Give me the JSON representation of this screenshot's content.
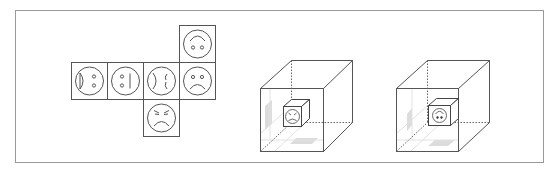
{
  "figure": {
    "type": "spatial-reasoning-puzzle",
    "frame_color": "#9a9a9a",
    "line_color": "#555555",
    "shade_color": "#d9d9d9",
    "net": {
      "description": "Unfolded cube net with six smiley-type faces",
      "faces": [
        {
          "id": "face-1",
          "position": "row-left-1",
          "expression": "side-face",
          "features": "half-circle mouth on left, two dots on right"
        },
        {
          "id": "face-2",
          "position": "row-left-2",
          "expression": "neutral-sideways",
          "features": "two dots on left, vertical line on right"
        },
        {
          "id": "face-3",
          "position": "row-center",
          "expression": "sideways-face",
          "features": "curved brackets on both sides"
        },
        {
          "id": "face-4",
          "position": "row-right",
          "expression": "sad",
          "features": "two dots, frown"
        },
        {
          "id": "face-5",
          "position": "top",
          "expression": "upside-down-smile",
          "features": "arc above, two dots below"
        },
        {
          "id": "face-6",
          "position": "bottom",
          "expression": "angry",
          "features": "slanted brows, frown"
        }
      ]
    },
    "cubes": [
      {
        "id": "cube-option-1",
        "inner_face": "angry-smile (rotated)",
        "description": "Wireframe cube containing small cube with face"
      },
      {
        "id": "cube-option-2",
        "inner_face": "upside-down-smile",
        "description": "Wireframe cube containing small cube with face"
      }
    ]
  }
}
